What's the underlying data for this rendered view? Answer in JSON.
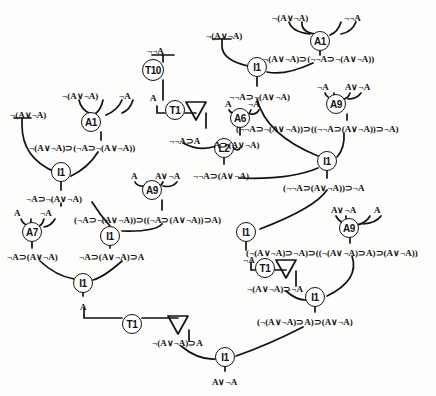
{
  "diagram": {
    "type": "proof-tree",
    "width": 436,
    "height": 396,
    "ink_color": "#111111",
    "background_color": "#fdfdfb",
    "conclusion": "A∨¬A"
  },
  "rule_nodes": [
    {
      "id": "T10",
      "label": "T10",
      "x": 153,
      "y": 70,
      "size": "md"
    },
    {
      "id": "T1a",
      "label": "T1",
      "x": 175,
      "y": 110,
      "size": "sm"
    },
    {
      "id": "A1L",
      "label": "A1",
      "x": 91,
      "y": 122,
      "size": "sm"
    },
    {
      "id": "A1R",
      "label": "A1",
      "x": 320,
      "y": 41,
      "size": "sm"
    },
    {
      "id": "I1TR",
      "label": "I1",
      "x": 257,
      "y": 67,
      "size": "sm"
    },
    {
      "id": "A6",
      "label": "A6",
      "x": 240,
      "y": 118,
      "size": "sm"
    },
    {
      "id": "A9R",
      "label": "A9",
      "x": 336,
      "y": 104,
      "size": "sm"
    },
    {
      "id": "L2",
      "label": "L2",
      "x": 224,
      "y": 148,
      "size": "sm"
    },
    {
      "id": "I1L1",
      "label": "I1",
      "x": 61,
      "y": 172,
      "size": "sm"
    },
    {
      "id": "A9L",
      "label": "A9",
      "x": 152,
      "y": 190,
      "size": "sm"
    },
    {
      "id": "I1M",
      "label": "I1",
      "x": 327,
      "y": 161,
      "size": "sm"
    },
    {
      "id": "A7",
      "label": "A7",
      "x": 32,
      "y": 232,
      "size": "sm"
    },
    {
      "id": "I1L2",
      "label": "I1",
      "x": 110,
      "y": 236,
      "size": "sm"
    },
    {
      "id": "I1R1",
      "label": "I1",
      "x": 246,
      "y": 232,
      "size": "sm"
    },
    {
      "id": "A9B",
      "label": "A9",
      "x": 349,
      "y": 228,
      "size": "sm"
    },
    {
      "id": "I1L3",
      "label": "I1",
      "x": 83,
      "y": 283,
      "size": "sm"
    },
    {
      "id": "T1b",
      "label": "T1",
      "x": 265,
      "y": 268,
      "size": "sm"
    },
    {
      "id": "T1c",
      "label": "T1",
      "x": 132,
      "y": 324,
      "size": "sm"
    },
    {
      "id": "I1R2",
      "label": "I1",
      "x": 315,
      "y": 297,
      "size": "sm"
    },
    {
      "id": "I1F",
      "label": "I1",
      "x": 225,
      "y": 357,
      "size": "sm"
    }
  ],
  "formulas": [
    {
      "id": "f_top_L_assump",
      "text": "¬(A∨¬A)",
      "x": 10,
      "y": 111
    },
    {
      "id": "f_A1L_p1",
      "text": "¬(A∨¬A)",
      "x": 62,
      "y": 92
    },
    {
      "id": "f_A1L_p2",
      "text": "¬A",
      "x": 119,
      "y": 92
    },
    {
      "id": "f_A1L_c",
      "text": "¬(A∨¬A)⊃(¬A⊃¬(A∨¬A))",
      "x": 29,
      "y": 144
    },
    {
      "id": "f_I1L1_c",
      "text": "¬A⊃¬(A∨¬A)",
      "x": 26,
      "y": 195
    },
    {
      "id": "f_A7_p1",
      "text": "A",
      "x": 14,
      "y": 209
    },
    {
      "id": "f_A7_p2",
      "text": "¬A",
      "x": 40,
      "y": 209
    },
    {
      "id": "f_A7_c",
      "text": "¬A⊃(A∨¬A)",
      "x": 7,
      "y": 253
    },
    {
      "id": "f_A9L_p1",
      "text": "A",
      "x": 131,
      "y": 172
    },
    {
      "id": "f_A9L_p2",
      "text": "A∨¬A",
      "x": 155,
      "y": 172
    },
    {
      "id": "f_A9L_c",
      "text": "(¬A⊃¬(A∨¬A))⊃((¬A⊃(A∨¬A))⊃A)",
      "x": 74,
      "y": 216
    },
    {
      "id": "f_I1L2_c",
      "text": "¬A⊃(A∨¬A)⊃A",
      "x": 79,
      "y": 253
    },
    {
      "id": "f_I1L3_c",
      "text": "A",
      "x": 80,
      "y": 303
    },
    {
      "id": "f_T1c_c",
      "text": "¬(A∨¬A)⊃A",
      "x": 152,
      "y": 339
    },
    {
      "id": "f_T10_p",
      "text": "¬¬A",
      "x": 147,
      "y": 47
    },
    {
      "id": "f_T10_c",
      "text": "A",
      "x": 150,
      "y": 94
    },
    {
      "id": "f_T1a_c",
      "text": "¬¬A⊃A",
      "x": 169,
      "y": 137
    },
    {
      "id": "f_A6_p1",
      "text": "A",
      "x": 225,
      "y": 100
    },
    {
      "id": "f_A6_p2",
      "text": "¬A",
      "x": 248,
      "y": 100
    },
    {
      "id": "f_A6_c",
      "text": "A⊃(A∨¬A)",
      "x": 214,
      "y": 141
    },
    {
      "id": "f_L2_c",
      "text": "¬¬A⊃(A∨¬A)",
      "x": 193,
      "y": 172
    },
    {
      "id": "f_A1R_p1",
      "text": "¬(A∨¬A)",
      "x": 272,
      "y": 14
    },
    {
      "id": "f_A1R_p2",
      "text": "¬¬A",
      "x": 344,
      "y": 14
    },
    {
      "id": "f_top_R_assump",
      "text": "¬(A∨¬A)",
      "x": 206,
      "y": 32
    },
    {
      "id": "f_A1R_c",
      "text": "¬(A∨¬A)⊃(¬¬A⊃¬(A∨¬A))",
      "x": 263,
      "y": 55
    },
    {
      "id": "f_I1TR_c",
      "text": "¬¬A⊃¬(A∨¬A)",
      "x": 229,
      "y": 93
    },
    {
      "id": "f_A9R_p1",
      "text": "¬A",
      "x": 317,
      "y": 83
    },
    {
      "id": "f_A9R_p2",
      "text": "A∨¬A",
      "x": 345,
      "y": 83
    },
    {
      "id": "f_A9R_c",
      "text": "(¬¬A⊃¬(A∨¬A))⊃((¬¬A⊃(A∨¬A))⊃¬A)",
      "x": 236,
      "y": 125
    },
    {
      "id": "f_I1M_c",
      "text": "(¬¬A⊃(A∨¬A))⊃¬A",
      "x": 283,
      "y": 184
    },
    {
      "id": "f_A9B_p1",
      "text": "A∨¬A",
      "x": 331,
      "y": 206
    },
    {
      "id": "f_A9B_p2",
      "text": "A",
      "x": 374,
      "y": 206
    },
    {
      "id": "f_A9B_c",
      "text": "(¬(A∨¬A)⊃¬A)⊃((¬(A∨¬A)⊃A)⊃(A∨¬A))",
      "x": 246,
      "y": 249
    },
    {
      "id": "f_I1R1_c",
      "text": "¬A",
      "x": 243,
      "y": 256
    },
    {
      "id": "f_T1b_c",
      "text": "¬(A∨¬A)⊃¬A",
      "x": 247,
      "y": 285
    },
    {
      "id": "f_I1R2_c",
      "text": "(¬(A∨¬A)⊃A)⊃(A∨¬A)",
      "x": 257,
      "y": 318
    },
    {
      "id": "f_final",
      "text": "A∨¬A",
      "x": 212,
      "y": 378
    }
  ],
  "discharge_markers": [
    {
      "id": "tri_a",
      "x": 196,
      "y": 103
    },
    {
      "id": "tri_b",
      "x": 286,
      "y": 261
    },
    {
      "id": "tri_c",
      "x": 178,
      "y": 317
    }
  ]
}
